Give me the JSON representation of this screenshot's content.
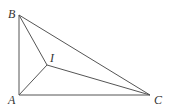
{
  "diagram": {
    "points": {
      "A": {
        "label": "A",
        "x": 19,
        "y": 95,
        "lx": 8,
        "ly": 104
      },
      "B": {
        "label": "B",
        "x": 19,
        "y": 15,
        "lx": 8,
        "ly": 18
      },
      "C": {
        "label": "C",
        "x": 150,
        "y": 95,
        "lx": 154,
        "ly": 104
      },
      "I": {
        "label": "I",
        "x": 47,
        "y": 65,
        "lx": 50,
        "ly": 62
      }
    },
    "segments": [
      [
        "A",
        "B"
      ],
      [
        "B",
        "C"
      ],
      [
        "A",
        "C"
      ],
      [
        "A",
        "I"
      ],
      [
        "B",
        "I"
      ],
      [
        "C",
        "I"
      ]
    ],
    "colors": {
      "stroke": "#555555",
      "label": "#333333"
    }
  }
}
